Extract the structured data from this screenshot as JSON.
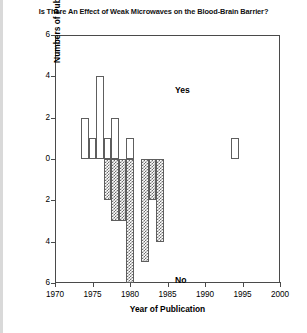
{
  "chart_data": {
    "type": "bar",
    "title": "Is There An Effect of Weak Microwaves on the Blood-Brain Barrier?",
    "xlabel": "Year of Publication",
    "ylabel": "Numbers of Publications (Papers or Abstracts)",
    "xlim": [
      1970,
      2000
    ],
    "ylim": [
      -6,
      6
    ],
    "xticks": [
      1970,
      1975,
      1980,
      1985,
      1990,
      1995,
      2000
    ],
    "xtick_labels": [
      "1970",
      "1975",
      "1980",
      "1985",
      "1990",
      "1995",
      "2000"
    ],
    "yticks": [
      6,
      4,
      2,
      0,
      -2,
      -4,
      -6
    ],
    "ytick_labels": [
      "6",
      "4",
      "2",
      "0",
      "2",
      "4",
      "6"
    ],
    "grid": false,
    "legend_position": "inline-annotations",
    "annotations": [
      {
        "text": "Yes",
        "x": 1986,
        "y": 3.6
      },
      {
        "text": "No",
        "x": 1986,
        "y": -5.6
      }
    ],
    "series": [
      {
        "name": "Yes",
        "direction": "up",
        "fill": "open",
        "points": [
          {
            "x": 1974,
            "value": 2
          },
          {
            "x": 1975,
            "value": 1
          },
          {
            "x": 1976,
            "value": 4
          },
          {
            "x": 1977,
            "value": 1
          },
          {
            "x": 1978,
            "value": 2
          },
          {
            "x": 1980,
            "value": 1
          },
          {
            "x": 1994,
            "value": 1
          }
        ]
      },
      {
        "name": "No",
        "direction": "down",
        "fill": "hatched",
        "points": [
          {
            "x": 1977,
            "value": -2
          },
          {
            "x": 1978,
            "value": -3
          },
          {
            "x": 1979,
            "value": -3
          },
          {
            "x": 1980,
            "value": -6
          },
          {
            "x": 1982,
            "value": -5
          },
          {
            "x": 1983,
            "value": -2
          },
          {
            "x": 1984,
            "value": -4
          }
        ]
      }
    ]
  }
}
